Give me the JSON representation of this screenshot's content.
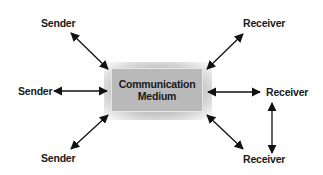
{
  "diagram": {
    "center": {
      "line1": "Communication",
      "line2": "Medium",
      "fill": "#b9b9b9"
    },
    "nodes": [
      {
        "id": "sender-top",
        "label": "Sender"
      },
      {
        "id": "sender-middle",
        "label": "Sender"
      },
      {
        "id": "sender-bottom",
        "label": "Sender"
      },
      {
        "id": "receiver-top",
        "label": "Receiver"
      },
      {
        "id": "receiver-middle",
        "label": "Receiver"
      },
      {
        "id": "receiver-bottom",
        "label": "Receiver"
      }
    ],
    "edges": [
      {
        "from": "sender-top",
        "to": "center",
        "type": "bidirectional"
      },
      {
        "from": "sender-middle",
        "to": "center",
        "type": "bidirectional"
      },
      {
        "from": "sender-bottom",
        "to": "center",
        "type": "bidirectional"
      },
      {
        "from": "receiver-top",
        "to": "center",
        "type": "bidirectional"
      },
      {
        "from": "receiver-middle",
        "to": "center",
        "type": "bidirectional"
      },
      {
        "from": "receiver-bottom",
        "to": "center",
        "type": "bidirectional"
      },
      {
        "from": "receiver-middle",
        "to": "receiver-bottom",
        "type": "bidirectional"
      }
    ],
    "arrow_color": "#111111"
  }
}
